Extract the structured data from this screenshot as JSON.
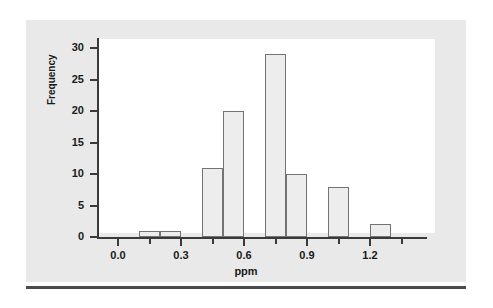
{
  "chart_data": {
    "type": "bar",
    "subtype": "histogram",
    "title": "",
    "xlabel": "ppm",
    "ylabel": "Frequency",
    "xlim": [
      -0.05,
      1.45
    ],
    "ylim": [
      0,
      31
    ],
    "grid": false,
    "legend": null,
    "bin_width": 0.1,
    "categories": [
      "0.1-0.2",
      "0.2-0.3",
      "0.4-0.5",
      "0.5-0.6",
      "0.7-0.8",
      "0.8-0.9",
      "1.0-1.1",
      "1.2-1.3"
    ],
    "values": [
      1,
      1,
      11,
      20,
      29,
      10,
      8,
      2
    ],
    "bins": [
      {
        "left": 0.1,
        "right": 0.2,
        "frequency": 1
      },
      {
        "left": 0.2,
        "right": 0.3,
        "frequency": 1
      },
      {
        "left": 0.4,
        "right": 0.5,
        "frequency": 11
      },
      {
        "left": 0.5,
        "right": 0.6,
        "frequency": 20
      },
      {
        "left": 0.7,
        "right": 0.8,
        "frequency": 29
      },
      {
        "left": 0.8,
        "right": 0.9,
        "frequency": 10
      },
      {
        "left": 1.0,
        "right": 1.1,
        "frequency": 8
      },
      {
        "left": 1.2,
        "right": 1.3,
        "frequency": 2
      }
    ],
    "y_ticks": [
      0,
      5,
      10,
      15,
      20,
      25,
      30
    ],
    "y_tick_labels": [
      "0",
      "5",
      "10",
      "15",
      "20",
      "25",
      "30"
    ],
    "x_ticks": [
      0.0,
      0.3,
      0.6,
      0.9,
      1.2
    ],
    "x_tick_labels": [
      "0.0",
      "0.3",
      "0.6",
      "0.9",
      "1.2"
    ],
    "x_minor_ticks": [
      0.15,
      0.45,
      0.75,
      1.05,
      1.35
    ],
    "colors": {
      "bar_fill": "#ededed",
      "bar_edge": "#737373",
      "axis": "#3a3a3a",
      "panel_background": "#e9e9e9",
      "plot_background": "#ffffff",
      "text": "#1a1a1a",
      "rule": "#4a4a4a"
    }
  }
}
